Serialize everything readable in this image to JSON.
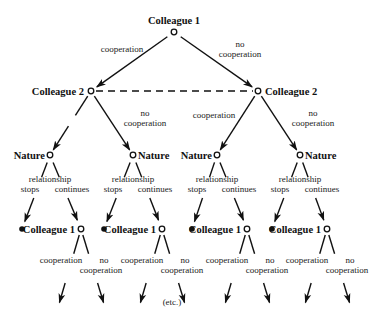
{
  "diagram": {
    "type": "game-tree",
    "colors": {
      "ink": "#111111",
      "background": "#ffffff"
    },
    "nodes": {
      "root": {
        "label": "Colleague 1",
        "x": 174,
        "y": 32,
        "label_x": 174,
        "label_y": 24,
        "anchor": "middle"
      },
      "c2_left": {
        "label": "Colleague 2",
        "x": 91,
        "y": 91,
        "label_x": 84,
        "label_y": 95,
        "anchor": "end"
      },
      "c2_right": {
        "label": "Colleague 2",
        "x": 258,
        "y": 91,
        "label_x": 265,
        "label_y": 95,
        "anchor": "start"
      },
      "nature": [
        {
          "label": "Nature",
          "x": 50,
          "y": 155,
          "label_x": 45,
          "label_y": 159,
          "anchor": "end"
        },
        {
          "label": "Nature",
          "x": 133,
          "y": 155,
          "label_x": 138,
          "label_y": 159,
          "anchor": "start"
        },
        {
          "label": "Nature",
          "x": 217,
          "y": 155,
          "label_x": 212,
          "label_y": 159,
          "anchor": "end"
        },
        {
          "label": "Nature",
          "x": 300,
          "y": 155,
          "label_x": 305,
          "label_y": 159,
          "anchor": "start"
        }
      ],
      "terminal_dots": [
        {
          "x": 22,
          "y": 229
        },
        {
          "x": 104,
          "y": 229
        },
        {
          "x": 192,
          "y": 229
        },
        {
          "x": 272,
          "y": 229
        }
      ],
      "c1_again": [
        {
          "label": "Colleague 1",
          "x": 81,
          "y": 229,
          "label_x": 75,
          "label_y": 233,
          "anchor": "end"
        },
        {
          "label": "Colleague 1",
          "x": 162,
          "y": 229,
          "label_x": 156,
          "label_y": 233,
          "anchor": "end"
        },
        {
          "label": "Colleague 1",
          "x": 247,
          "y": 229,
          "label_x": 241,
          "label_y": 233,
          "anchor": "end"
        },
        {
          "label": "Colleague 1",
          "x": 327,
          "y": 229,
          "label_x": 321,
          "label_y": 233,
          "anchor": "end"
        }
      ]
    },
    "edge_labels": {
      "root_left": {
        "lines": [
          "cooperation"
        ],
        "x": 122,
        "y": 52
      },
      "root_right": {
        "lines": [
          "no",
          "cooperation"
        ],
        "x": 240,
        "y": 47
      },
      "c2_left_left": {
        "lines": [],
        "x": 0,
        "y": 0
      },
      "c2_left_right": {
        "lines": [
          "no",
          "cooperation"
        ],
        "x": 145,
        "y": 116
      },
      "c2_right_left": {
        "lines": [
          "cooperation"
        ],
        "x": 214,
        "y": 118
      },
      "c2_right_right": {
        "lines": [
          "no",
          "cooperation"
        ],
        "x": 313,
        "y": 116
      },
      "nature_labels": {
        "top": "relationship",
        "left": "stops",
        "right": "continues"
      },
      "c1_labels": {
        "left": "cooperation",
        "right_top": "no",
        "right_bottom": "cooperation"
      }
    },
    "footer": {
      "text": "(etc.)",
      "x": 172,
      "y": 305
    }
  }
}
